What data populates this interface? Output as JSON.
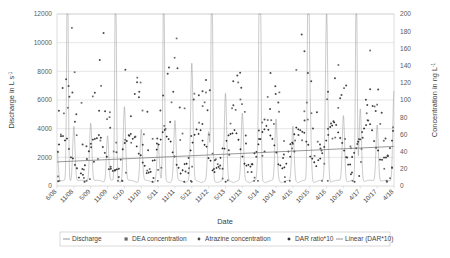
{
  "chart_data": {
    "type": "scatter",
    "title": "",
    "xlabel": "Date",
    "ylabel": "Discharge in L s-1",
    "y2label": "Concentration in ng L-1",
    "ylim": [
      0,
      12000
    ],
    "y2lim": [
      0,
      200
    ],
    "yticks": [
      0,
      2000,
      4000,
      6000,
      8000,
      10000,
      12000
    ],
    "y2ticks": [
      0,
      20,
      40,
      60,
      80,
      100,
      120,
      140,
      160,
      180,
      200
    ],
    "xticks": [
      "6/08",
      "11/08",
      "5/09",
      "11/09",
      "5/10",
      "11/10",
      "5/11",
      "11/11",
      "5/12",
      "11/12",
      "5/13",
      "11/13",
      "5/14",
      "10/14",
      "4/15",
      "10/15",
      "4/16",
      "10/16",
      "4/17",
      "10/17",
      "4/18"
    ],
    "grid": true,
    "legend_position": "bottom",
    "series": [
      {
        "name": "Discharge",
        "type": "line",
        "axis": "left",
        "unit": "L s-1",
        "color": "#8a8a8a",
        "note": "continuous hydrograph with sharp storm peaks; baseflow near 200-600 L/s, peaks 2000-12000 L/s"
      },
      {
        "name": "DEA concentration",
        "type": "scatter",
        "axis": "right",
        "unit": "ng L-1",
        "color": "#6b6b6b",
        "marker": "square"
      },
      {
        "name": "Atrazine concentration",
        "type": "scatter",
        "axis": "right",
        "unit": "ng L-1",
        "color": "#4a4a4a",
        "marker": "circle"
      },
      {
        "name": "DAR ratio*10",
        "type": "scatter",
        "axis": "right",
        "unit": "ratio x10",
        "color": "#2f2f2f",
        "marker": "diamond"
      },
      {
        "name": "Linear (DAR*10)",
        "type": "line",
        "axis": "right",
        "color": "#7d7d7d",
        "note": "linear trend of DAR*10, rising left to right from about 28 to about 44"
      }
    ],
    "discharge_peaks": [
      {
        "x": "6/08",
        "value": 2300
      },
      {
        "x": "11/08",
        "value": 3900
      },
      {
        "x": "5/09",
        "value": 4100
      },
      {
        "x": "11/09",
        "value": 3200
      },
      {
        "x": "5/10",
        "value": 5200
      },
      {
        "x": "11/10",
        "value": 3600
      },
      {
        "x": "5/11",
        "value": 2600
      },
      {
        "x": "11/11",
        "value": 4200
      },
      {
        "x": "5/12",
        "value": 8200
      },
      {
        "x": "11/12",
        "value": 3400
      },
      {
        "x": "5/13",
        "value": 6100
      },
      {
        "x": "11/13",
        "value": 4700
      },
      {
        "x": "5/14",
        "value": 5600
      },
      {
        "x": "10/14",
        "value": 4300
      },
      {
        "x": "4/15",
        "value": 3800
      },
      {
        "x": "10/15",
        "value": 5900
      },
      {
        "x": "4/16",
        "value": 11900
      },
      {
        "x": "10/16",
        "value": 4600
      },
      {
        "x": "4/17",
        "value": 5100
      },
      {
        "x": "10/17",
        "value": 4000
      },
      {
        "x": "4/18",
        "value": 6400
      }
    ],
    "atrazine_range": [
      5,
      185
    ],
    "dea_range": [
      8,
      160
    ],
    "dar_range": [
      10,
      75
    ],
    "trend_start": 28,
    "trend_end": 46
  },
  "legend": {
    "items": [
      {
        "label": "Discharge",
        "marker": "line"
      },
      {
        "label": "DEA concentration",
        "marker": "square"
      },
      {
        "label": "Atrazine concentration",
        "marker": "circle"
      },
      {
        "label": "DAR ratio*10",
        "marker": "diamond"
      },
      {
        "label": "Linear (DAR*10)",
        "marker": "line"
      }
    ]
  },
  "axes": {
    "left_title_main": "Discharge in L s",
    "left_title_sup": "-1",
    "right_title_main": "Concentration in ng L",
    "right_title_sup": "-1",
    "x_title": "Date"
  },
  "colors": {
    "grid": "#d6d6d6",
    "frame": "#cfcfcf",
    "text": "#3f3f3f",
    "discharge": "#8a8a8a",
    "trend": "#7d7d7d"
  }
}
